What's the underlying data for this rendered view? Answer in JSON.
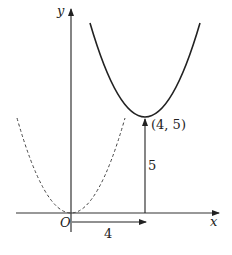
{
  "diagram": {
    "axes": {
      "x_label": "x",
      "y_label": "y",
      "origin_label": "O"
    },
    "curves": [
      {
        "name": "translated parabola",
        "style": "solid",
        "vertex": [
          4,
          5
        ]
      },
      {
        "name": "original parabola",
        "style": "dashed",
        "vertex": [
          0,
          0
        ]
      }
    ],
    "annotations": {
      "vertex_label": "(4, 5)",
      "vertical_shift": "5",
      "horizontal_shift": "4"
    }
  }
}
